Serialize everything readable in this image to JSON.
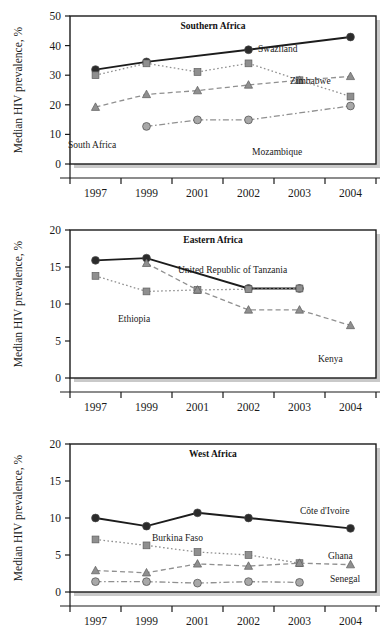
{
  "figure": {
    "panel_count": 3,
    "ylabel": "Median HIV prevalence, %",
    "categories": [
      "1997",
      "1999",
      "2001",
      "2002",
      "2003",
      "2004"
    ],
    "colors": {
      "dark": "#2b2b2b",
      "mid_gray": "#8f8f8f",
      "light_gray": "#a8a8a8",
      "axis": "#1a1a1a",
      "background": "#ffffff"
    }
  },
  "chart_data": [
    {
      "type": "line",
      "title": "Southern Africa",
      "xlabel": "",
      "ylabel": "Median HIV prevalence, %",
      "categories": [
        "1997",
        "1999",
        "2001",
        "2002",
        "2003",
        "2004"
      ],
      "ylim": [
        0,
        50
      ],
      "yticks": [
        0,
        10,
        20,
        30,
        40,
        50
      ],
      "grid": false,
      "legend": "inline-annotations",
      "series": [
        {
          "name": "Swaziland",
          "marker": "circle",
          "color": "#2b2b2b",
          "linestyle": "solid",
          "values": [
            31.9,
            34.5,
            null,
            38.6,
            null,
            42.9
          ],
          "label_x": "2003",
          "label_anchor": "end"
        },
        {
          "name": "Zimbabwe",
          "marker": "square",
          "color": "#8f8f8f",
          "linestyle": "dotted",
          "values": [
            30.0,
            34.0,
            31.1,
            34.0,
            28.3,
            22.8
          ],
          "label_x": "2003",
          "label_anchor": "start"
        },
        {
          "name": "South Africa",
          "marker": "triangle",
          "color": "#8f8f8f",
          "linestyle": "dashed",
          "values": [
            19.2,
            23.5,
            24.8,
            26.7,
            28.3,
            29.6
          ],
          "label_x": "1997",
          "label_anchor": "start"
        },
        {
          "name": "Mozambique",
          "marker": "circle",
          "color": "#a8a8a8",
          "linestyle": "dashdot",
          "values": [
            null,
            12.7,
            14.9,
            14.9,
            null,
            19.6
          ],
          "label_x": "2003",
          "label_anchor": "start"
        }
      ]
    },
    {
      "type": "line",
      "title": "Eastern Africa",
      "xlabel": "",
      "ylabel": "Median HIV prevalence, %",
      "categories": [
        "1997",
        "1999",
        "2001",
        "2002",
        "2003",
        "2004"
      ],
      "ylim": [
        0,
        20
      ],
      "yticks": [
        0,
        5,
        10,
        15,
        20
      ],
      "grid": false,
      "legend": "inline-annotations",
      "series": [
        {
          "name": "United Republic of Tanzania",
          "marker": "circle",
          "color": "#2b2b2b",
          "linestyle": "solid",
          "values": [
            15.9,
            16.2,
            null,
            12.1,
            12.1,
            null
          ],
          "label_x": "2001",
          "label_anchor": "start"
        },
        {
          "name": "Ethiopia",
          "marker": "square",
          "color": "#8f8f8f",
          "linestyle": "dotted",
          "values": [
            13.8,
            11.7,
            11.9,
            12.0,
            12.1,
            null
          ],
          "label_x": "1999",
          "label_anchor": "start"
        },
        {
          "name": "Kenya",
          "marker": "triangle",
          "color": "#8f8f8f",
          "linestyle": "dashed",
          "values": [
            null,
            15.5,
            11.9,
            9.2,
            9.2,
            7.1
          ],
          "label_x": "2003",
          "label_anchor": "end"
        }
      ]
    },
    {
      "type": "line",
      "title": "West Africa",
      "xlabel": "",
      "ylabel": "Median HIV prevalence, %",
      "categories": [
        "1997",
        "1999",
        "2001",
        "2002",
        "2003",
        "2004"
      ],
      "ylim": [
        0,
        20
      ],
      "yticks": [
        0,
        5,
        10,
        15,
        20
      ],
      "grid": false,
      "legend": "inline-annotations",
      "series": [
        {
          "name": "Côte d'Ivoire",
          "marker": "circle",
          "color": "#2b2b2b",
          "linestyle": "solid",
          "values": [
            10.0,
            8.9,
            10.7,
            10.0,
            null,
            8.6
          ],
          "label_x": "2003",
          "label_anchor": "start"
        },
        {
          "name": "Burkina Faso",
          "marker": "square",
          "color": "#8f8f8f",
          "linestyle": "dotted",
          "values": [
            7.1,
            6.3,
            5.4,
            5.0,
            3.9,
            null
          ],
          "label_x": "1999",
          "label_anchor": "start"
        },
        {
          "name": "Ghana",
          "marker": "triangle",
          "color": "#8f8f8f",
          "linestyle": "dashed",
          "values": [
            2.9,
            2.6,
            3.8,
            3.5,
            3.9,
            3.7
          ],
          "label_x": "2003",
          "label_anchor": "start"
        },
        {
          "name": "Senegal",
          "marker": "circle",
          "color": "#a8a8a8",
          "linestyle": "dashdot",
          "values": [
            1.4,
            1.4,
            1.2,
            1.4,
            1.3,
            null
          ],
          "label_x": "2003",
          "label_anchor": "start"
        }
      ]
    }
  ],
  "annotations": {
    "panel0": [
      {
        "text": "Swaziland",
        "x": 258,
        "y": 52
      },
      {
        "text": "Zimbabwe",
        "x": 290,
        "y": 84
      },
      {
        "text": "South Africa",
        "x": 68,
        "y": 148
      },
      {
        "text": "Mozambique",
        "x": 252,
        "y": 155
      }
    ],
    "panel1": [
      {
        "text": "United Republic of Tanzania",
        "x": 178,
        "y": 273
      },
      {
        "text": "Ethiopia",
        "x": 118,
        "y": 322
      },
      {
        "text": "Kenya",
        "x": 318,
        "y": 362
      }
    ],
    "panel2": [
      {
        "text": "Côte d'Ivoire",
        "x": 300,
        "y": 514
      },
      {
        "text": "Burkina Faso",
        "x": 152,
        "y": 541
      },
      {
        "text": "Ghana",
        "x": 328,
        "y": 559
      },
      {
        "text": "Senegal",
        "x": 330,
        "y": 582
      }
    ]
  }
}
